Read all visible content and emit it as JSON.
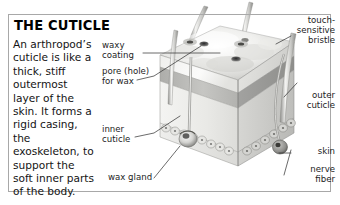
{
  "panel": {
    "title": "THE CUTICLE",
    "body_text": "An arthropod’s cuticle is like a thick, stiff outermost layer of the skin. It forms a rigid casing, the exoskeleton, to support the soft inner parts of the body."
  },
  "labels": {
    "waxy_coating": "waxy\ncoating",
    "pore_for_wax": "pore (hole)\nfor wax",
    "inner_cuticle": "inner\ncuticle",
    "wax_gland": "wax gland",
    "touch_sensitive_bristle": "touch-\nsensitive\nbristle",
    "outer_cuticle": "outer\ncuticle",
    "skin": "skin",
    "nerve_fiber": "nerve\nfiber"
  },
  "illustration": {
    "subject": "arthropod-cuticle-block-diagram",
    "description": "Cut-away cube of arthropod integument showing waxy coating, pores, outer and inner cuticle layers, skin cell layer, wax gland, nerve fiber and touch-sensitive bristles."
  },
  "colors": {
    "frame_border": "#a8a8a8",
    "leader_line": "#3a3a3a",
    "text": "#1a1a1a",
    "background": "#ffffff",
    "cuticle_light": "#f2f2f0",
    "cuticle_mid": "#cfcfcf",
    "cuticle_dark": "#9a9a9a",
    "bristle": "#b5b5b0"
  }
}
